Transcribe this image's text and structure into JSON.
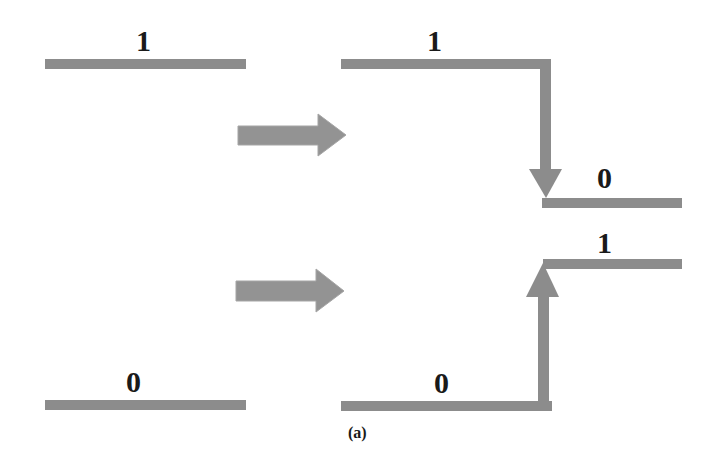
{
  "diagram": {
    "caption": "(a)",
    "colors": {
      "line": "#8c8c8c",
      "arrow": "#939393",
      "text": "#1a1a1a"
    },
    "top_row": {
      "before_label": "1",
      "after_high_label": "1",
      "after_low_label": "0",
      "transition": "high-to-low"
    },
    "bottom_row": {
      "before_label": "0",
      "after_low_label": "0",
      "after_high_label": "1",
      "transition": "low-to-high"
    },
    "arrows": [
      "right-arrow",
      "right-arrow"
    ]
  }
}
